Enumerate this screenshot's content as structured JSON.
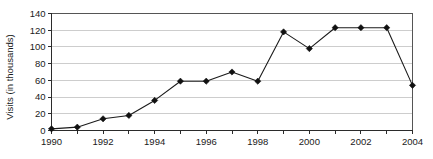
{
  "chart_data": {
    "type": "line",
    "title": "",
    "subtitle": "",
    "xlabel": "",
    "ylabel": "Visits (in thousands)",
    "x": [
      1990,
      1991,
      1992,
      1993,
      1994,
      1995,
      1996,
      1997,
      1998,
      1999,
      2000,
      2001,
      2002,
      2003,
      2004
    ],
    "values": [
      2,
      4,
      14,
      18,
      36,
      59,
      59,
      70,
      59,
      118,
      98,
      123,
      123,
      123,
      54
    ],
    "series": [
      {
        "name": "Visits",
        "values": [
          2,
          4,
          14,
          18,
          36,
          59,
          59,
          70,
          59,
          118,
          98,
          123,
          123,
          123,
          54
        ]
      }
    ],
    "xlim": [
      1990,
      2004
    ],
    "ylim": [
      0,
      140
    ],
    "y_ticks": [
      0,
      20,
      40,
      60,
      80,
      100,
      120,
      140
    ],
    "y_tick_labels": [
      "0",
      "20",
      "40",
      "60",
      "80",
      "100",
      "120",
      "140"
    ],
    "x_ticks": [
      1990,
      1991,
      1992,
      1993,
      1994,
      1995,
      1996,
      1997,
      1998,
      1999,
      2000,
      2001,
      2002,
      2003,
      2004
    ],
    "x_tick_labels": [
      "1990",
      "",
      "1992",
      "",
      "1994",
      "",
      "1996",
      "",
      "1998",
      "",
      "2000",
      "",
      "2002",
      "",
      "2004"
    ],
    "x_labeled_ticks": [
      "1990",
      "1992",
      "1994",
      "1996",
      "1998",
      "2000",
      "2002",
      "2004"
    ],
    "grid": true,
    "grid_axis": "y",
    "legend": false,
    "legend_position": "none",
    "marker": "diamond",
    "colors": {
      "line": "#1b1b1b",
      "marker": "#111111",
      "gridline": "#c8c8c8",
      "axis": "#2b2b2b",
      "frame": "#555555",
      "background": "#ffffff",
      "text": "#1a1a1a"
    },
    "annotations": []
  }
}
